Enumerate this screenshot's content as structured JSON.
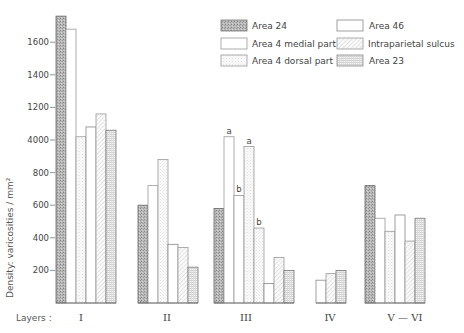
{
  "chart_data": {
    "type": "bar",
    "title": "",
    "xlabel": "Layers :",
    "ylabel": "Density: varicosities / mm²",
    "ylim": [
      0,
      1760
    ],
    "yticks": [
      200,
      400,
      600,
      800,
      1000,
      1200,
      1400,
      1600
    ],
    "ytick_labels": [
      "200",
      "400",
      "600",
      "800",
      "4000",
      "1200",
      "1400",
      "1600"
    ],
    "grid": false,
    "legend_position": "top-right",
    "categories": [
      "I",
      "II",
      "III",
      "IV",
      "V — VI"
    ],
    "legend": [
      {
        "name": "Area 24",
        "pattern": "dark-stipple"
      },
      {
        "name": "Area 4 medial part",
        "pattern": "white"
      },
      {
        "name": "Area 4 dorsal part",
        "pattern": "light-stipple"
      },
      {
        "name": "Area 46",
        "pattern": "white"
      },
      {
        "name": "Intraparietal sulcus",
        "pattern": "diagonal-hatch"
      },
      {
        "name": "Area 23",
        "pattern": "grid"
      }
    ],
    "groups": [
      {
        "category": "I",
        "bars": [
          {
            "series": "Area 24",
            "value": 1760
          },
          {
            "series": "Area 4 medial part",
            "value": 1680
          },
          {
            "series": "Area 4 dorsal part",
            "value": 1020
          },
          {
            "series": "Area 46",
            "value": 1080
          },
          {
            "series": "Intraparietal sulcus",
            "value": 1160
          },
          {
            "series": "Area 23",
            "value": 1060
          }
        ]
      },
      {
        "category": "II",
        "bars": [
          {
            "series": "Area 24",
            "value": 600
          },
          {
            "series": "Area 4 medial part",
            "value": 720
          },
          {
            "series": "Area 4 dorsal part",
            "value": 880
          },
          {
            "series": "Area 46",
            "value": 360
          },
          {
            "series": "Intraparietal sulcus",
            "value": 340
          },
          {
            "series": "Area 23",
            "value": 220
          }
        ]
      },
      {
        "category": "III",
        "bars": [
          {
            "series": "Area 24",
            "value": 580
          },
          {
            "series": "Area 4 medial part",
            "value": 1020,
            "note": "a"
          },
          {
            "series": "Area 4 medial part",
            "value": 660,
            "note": "b"
          },
          {
            "series": "Area 4 dorsal part",
            "value": 960,
            "note": "a"
          },
          {
            "series": "Area 4 dorsal part",
            "value": 460,
            "note": "b"
          },
          {
            "series": "Area 46",
            "value": 120
          },
          {
            "series": "Intraparietal sulcus",
            "value": 280
          },
          {
            "series": "Area 23",
            "value": 200
          }
        ]
      },
      {
        "category": "IV",
        "bars": [
          {
            "series": "Area 46",
            "value": 140
          },
          {
            "series": "Intraparietal sulcus",
            "value": 180
          },
          {
            "series": "Area 23",
            "value": 200
          }
        ]
      },
      {
        "category": "V — VI",
        "bars": [
          {
            "series": "Area 24",
            "value": 720
          },
          {
            "series": "Area 4 medial part",
            "value": 520
          },
          {
            "series": "Area 4 dorsal part",
            "value": 440
          },
          {
            "series": "Area 46",
            "value": 540
          },
          {
            "series": "Intraparietal sulcus",
            "value": 380
          },
          {
            "series": "Area 23",
            "value": 520
          }
        ]
      }
    ],
    "series": [
      {
        "name": "Area 24",
        "values": [
          1760,
          600,
          580,
          null,
          720
        ]
      },
      {
        "name": "Area 4 medial part",
        "values": [
          1680,
          720,
          1020,
          null,
          520
        ]
      },
      {
        "name": "Area 4 dorsal part",
        "values": [
          1020,
          880,
          960,
          null,
          440
        ]
      },
      {
        "name": "Area 46",
        "values": [
          1080,
          360,
          120,
          140,
          540
        ]
      },
      {
        "name": "Intraparietal sulcus",
        "values": [
          1160,
          340,
          280,
          180,
          380
        ]
      },
      {
        "name": "Area 23",
        "values": [
          1060,
          220,
          200,
          200,
          520
        ]
      }
    ],
    "annotations": [
      {
        "category": "III",
        "series": "Area 4 medial part",
        "label": "a",
        "value": 1020
      },
      {
        "category": "III",
        "series": "Area 4 medial part",
        "label": "b",
        "value": 660
      },
      {
        "category": "III",
        "series": "Area 4 dorsal part",
        "label": "a",
        "value": 960
      },
      {
        "category": "III",
        "series": "Area 4 dorsal part",
        "label": "b",
        "value": 460
      }
    ]
  },
  "layout": {
    "baseline_y": 303,
    "px_per_unit": 0.163,
    "bar_width": 10,
    "group_x": [
      56,
      138,
      214,
      316,
      365
    ],
    "cat_label_x": [
      81,
      167,
      246,
      330,
      405
    ]
  }
}
